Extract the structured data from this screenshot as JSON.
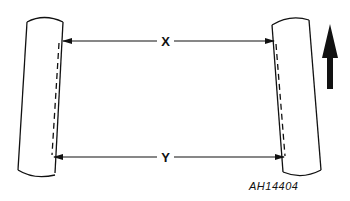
{
  "diagram": {
    "type": "wheel-toe-in-measurement",
    "labels": {
      "front_dimension": "X",
      "rear_dimension": "Y",
      "reference_code": "AH14404"
    },
    "elements": {
      "left_wheel": "tyre viewed from above (left)",
      "right_wheel": "tyre viewed from above (right)",
      "direction_arrow": "forward direction of travel"
    },
    "colors": {
      "line": "#111111",
      "background": "#ffffff"
    }
  }
}
